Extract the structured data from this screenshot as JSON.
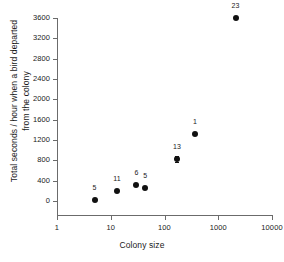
{
  "chart_data": {
    "type": "scatter",
    "title": "",
    "xlabel": "Colony size",
    "ylabel": "Total seconds / hour when a bird departed from the colony",
    "xscale": "log",
    "yscale": "linear",
    "xlim": [
      1,
      10000
    ],
    "ylim": [
      0,
      3600
    ],
    "grid": false,
    "legend": null,
    "xticks": [
      "1",
      "10",
      "100",
      "1000",
      "10000"
    ],
    "xtick_values": [
      1,
      10,
      100,
      1000,
      10000
    ],
    "yticks": [
      "0",
      "400",
      "800",
      "1200",
      "1600",
      "2000",
      "2400",
      "2800",
      "3200",
      "3600"
    ],
    "ytick_values": [
      0,
      400,
      800,
      1200,
      1600,
      2000,
      2400,
      2800,
      3200,
      3600
    ],
    "points": [
      {
        "label": "5",
        "x": 5,
        "y": 30,
        "yerr": 0
      },
      {
        "label": "11",
        "x": 13,
        "y": 190,
        "yerr": 0
      },
      {
        "label": "6",
        "x": 30,
        "y": 320,
        "yerr": 0
      },
      {
        "label": "5",
        "x": 44,
        "y": 265,
        "yerr": 0
      },
      {
        "label": "13",
        "x": 170,
        "y": 830,
        "yerr": 60
      },
      {
        "label": "1",
        "x": 370,
        "y": 1320,
        "yerr": 0
      },
      {
        "label": "23",
        "x": 2100,
        "y": 3600,
        "yerr": 0
      }
    ],
    "point_label_meaning": "sample size (n) annotated above each data point",
    "marker_color": "#111111",
    "axis_color": "#6b6b6b",
    "text_color": "#1a1a1a",
    "background_color": "#ffffff"
  }
}
